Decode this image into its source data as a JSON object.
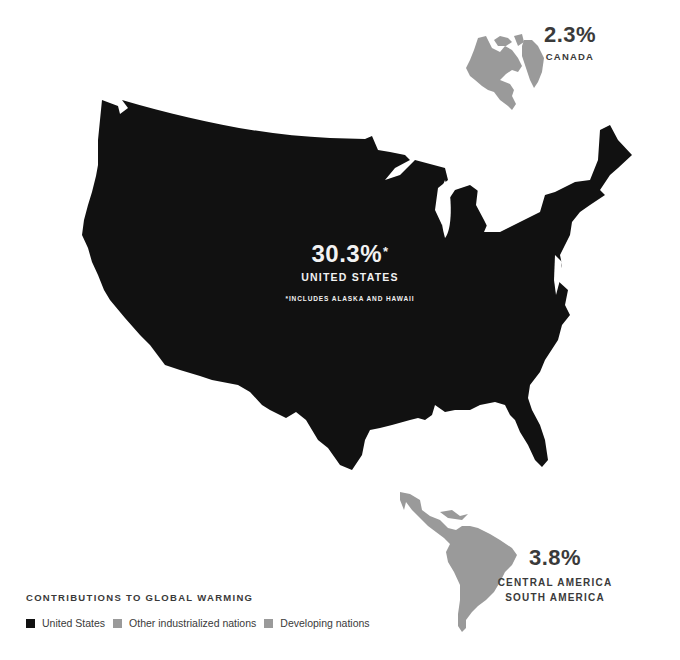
{
  "title": "Contributions to Global Warming",
  "colors": {
    "united_states": "#111111",
    "other_industrialized": "#9a9a9a",
    "developing": "#9a9a9a",
    "background": "#ffffff"
  },
  "regions": {
    "united_states": {
      "percent": "30.3%",
      "footnote_marker": "*",
      "name": "UNITED STATES",
      "note": "*INCLUDES ALASKA AND HAWAII"
    },
    "canada": {
      "percent": "2.3%",
      "name": "CANADA"
    },
    "central_south_america": {
      "percent": "3.8%",
      "name_line1": "CENTRAL AMERICA",
      "name_line2": "SOUTH AMERICA"
    }
  },
  "legend": {
    "title": "CONTRIBUTIONS TO GLOBAL WARMING",
    "items": [
      {
        "label": "United States",
        "color": "#111111"
      },
      {
        "label": "Other industrialized nations",
        "color": "#9a9a9a"
      },
      {
        "label": "Developing nations",
        "color": "#9a9a9a"
      }
    ]
  }
}
